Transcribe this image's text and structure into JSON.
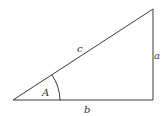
{
  "diagram": {
    "type": "right-triangle",
    "stroke_color": "#3a3a3a",
    "labels": {
      "hypotenuse": "c",
      "opposite": "a",
      "adjacent": "b",
      "angle": "A"
    },
    "vertices": {
      "angle_vertex": [
        13,
        100
      ],
      "right_angle_vertex": [
        153,
        100
      ],
      "top_vertex": [
        153,
        9
      ]
    }
  }
}
